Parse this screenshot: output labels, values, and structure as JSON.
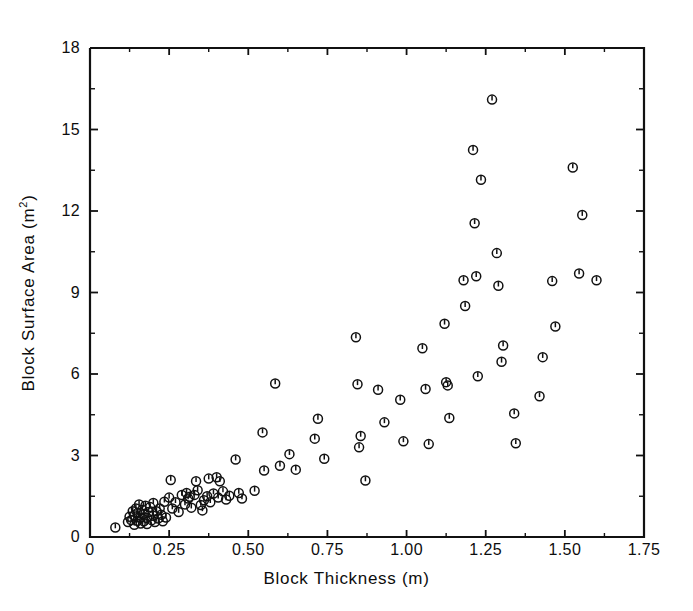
{
  "figure": {
    "type": "scatter-plot",
    "background": "#ffffff",
    "ink_color": "#111111"
  },
  "chart_data": {
    "type": "scatter",
    "title": "",
    "xlabel": "Block Thickness (m)",
    "ylabel": "Block Surface Area (m2)",
    "ylabel_display": "Block Surface Area (m",
    "ylabel_sup": "2",
    "ylabel_tail": ")",
    "xlim": [
      0,
      1.75
    ],
    "ylim": [
      0,
      18
    ],
    "xticks": [
      0,
      0.25,
      0.5,
      0.75,
      1.0,
      1.25,
      1.5,
      1.75
    ],
    "xticklabels": [
      "0",
      "0.25",
      "0.50",
      "0.75",
      "1.00",
      "1.25",
      "1.50",
      "1.75"
    ],
    "yticks": [
      0,
      3,
      6,
      9,
      12,
      15,
      18
    ],
    "yticklabels": [
      "0",
      "3",
      "6",
      "9",
      "12",
      "15",
      "18"
    ],
    "grid": false,
    "legend": null,
    "marker": "circle-with-vertical-tick",
    "marker_size_px": 9,
    "series": [
      {
        "name": "blocks",
        "points": [
          [
            0.08,
            0.35
          ],
          [
            0.12,
            0.55
          ],
          [
            0.125,
            0.75
          ],
          [
            0.13,
            0.62
          ],
          [
            0.135,
            0.95
          ],
          [
            0.14,
            0.45
          ],
          [
            0.14,
            0.8
          ],
          [
            0.145,
            1.05
          ],
          [
            0.15,
            0.6
          ],
          [
            0.15,
            0.88
          ],
          [
            0.155,
            1.2
          ],
          [
            0.16,
            0.5
          ],
          [
            0.16,
            0.72
          ],
          [
            0.165,
            1.0
          ],
          [
            0.17,
            0.58
          ],
          [
            0.17,
            0.85
          ],
          [
            0.175,
            1.15
          ],
          [
            0.18,
            0.48
          ],
          [
            0.18,
            0.7
          ],
          [
            0.185,
            0.92
          ],
          [
            0.19,
            1.1
          ],
          [
            0.195,
            0.62
          ],
          [
            0.2,
            0.78
          ],
          [
            0.2,
            1.25
          ],
          [
            0.205,
            0.55
          ],
          [
            0.21,
            0.95
          ],
          [
            0.215,
            0.68
          ],
          [
            0.22,
            1.05
          ],
          [
            0.225,
            0.82
          ],
          [
            0.23,
            0.58
          ],
          [
            0.235,
            1.3
          ],
          [
            0.24,
            0.72
          ],
          [
            0.25,
            1.45
          ],
          [
            0.255,
            2.1
          ],
          [
            0.26,
            1.05
          ],
          [
            0.27,
            1.28
          ],
          [
            0.28,
            0.92
          ],
          [
            0.29,
            1.55
          ],
          [
            0.3,
            1.2
          ],
          [
            0.305,
            1.62
          ],
          [
            0.31,
            1.42
          ],
          [
            0.315,
            1.48
          ],
          [
            0.32,
            1.08
          ],
          [
            0.33,
            1.55
          ],
          [
            0.335,
            2.05
          ],
          [
            0.34,
            1.72
          ],
          [
            0.35,
            1.18
          ],
          [
            0.355,
            0.98
          ],
          [
            0.36,
            1.35
          ],
          [
            0.37,
            1.5
          ],
          [
            0.375,
            2.15
          ],
          [
            0.38,
            1.28
          ],
          [
            0.39,
            1.6
          ],
          [
            0.4,
            2.2
          ],
          [
            0.405,
            1.45
          ],
          [
            0.41,
            2.05
          ],
          [
            0.42,
            1.68
          ],
          [
            0.43,
            1.38
          ],
          [
            0.44,
            1.52
          ],
          [
            0.46,
            2.85
          ],
          [
            0.47,
            1.62
          ],
          [
            0.48,
            1.42
          ],
          [
            0.52,
            1.7
          ],
          [
            0.545,
            3.85
          ],
          [
            0.55,
            2.45
          ],
          [
            0.585,
            5.65
          ],
          [
            0.6,
            2.62
          ],
          [
            0.63,
            3.05
          ],
          [
            0.65,
            2.48
          ],
          [
            0.71,
            3.62
          ],
          [
            0.72,
            4.35
          ],
          [
            0.74,
            2.88
          ],
          [
            0.84,
            7.35
          ],
          [
            0.845,
            5.62
          ],
          [
            0.85,
            3.3
          ],
          [
            0.855,
            3.72
          ],
          [
            0.87,
            2.08
          ],
          [
            0.91,
            5.42
          ],
          [
            0.93,
            4.22
          ],
          [
            0.98,
            5.05
          ],
          [
            0.99,
            3.52
          ],
          [
            1.05,
            6.95
          ],
          [
            1.06,
            5.45
          ],
          [
            1.07,
            3.42
          ],
          [
            1.12,
            7.85
          ],
          [
            1.125,
            5.7
          ],
          [
            1.13,
            5.58
          ],
          [
            1.135,
            4.38
          ],
          [
            1.18,
            9.45
          ],
          [
            1.185,
            8.5
          ],
          [
            1.21,
            14.25
          ],
          [
            1.215,
            11.55
          ],
          [
            1.22,
            9.6
          ],
          [
            1.225,
            5.92
          ],
          [
            1.235,
            13.15
          ],
          [
            1.27,
            16.1
          ],
          [
            1.285,
            10.45
          ],
          [
            1.29,
            9.25
          ],
          [
            1.3,
            6.45
          ],
          [
            1.305,
            7.05
          ],
          [
            1.34,
            4.55
          ],
          [
            1.345,
            3.45
          ],
          [
            1.42,
            5.18
          ],
          [
            1.43,
            6.62
          ],
          [
            1.46,
            9.42
          ],
          [
            1.47,
            7.75
          ],
          [
            1.525,
            13.6
          ],
          [
            1.545,
            9.7
          ],
          [
            1.555,
            11.85
          ],
          [
            1.6,
            9.45
          ]
        ]
      }
    ]
  }
}
